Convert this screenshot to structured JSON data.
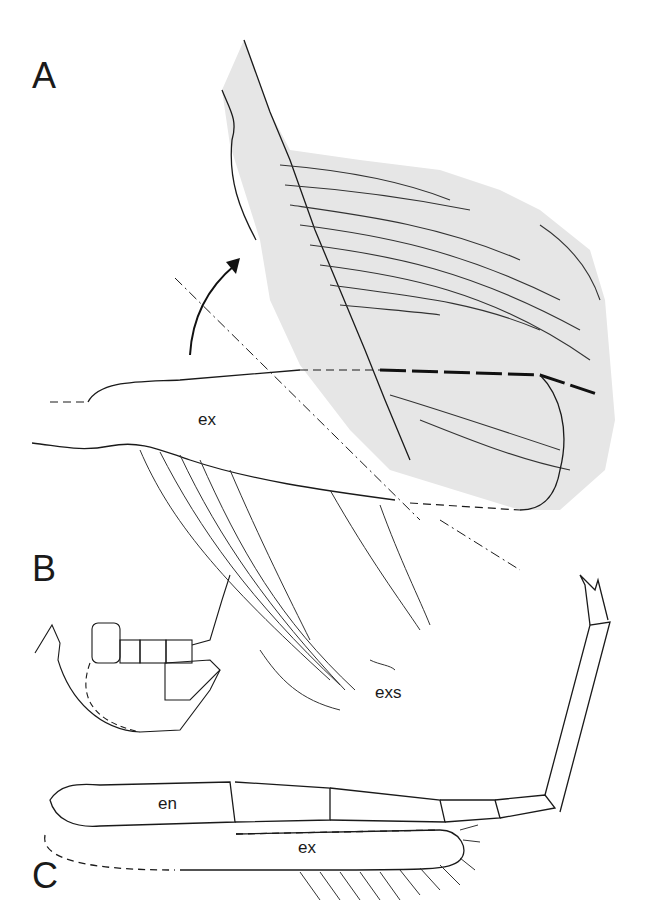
{
  "figure": {
    "panels": [
      {
        "id": "A",
        "label": "A"
      },
      {
        "id": "B",
        "label": "B"
      },
      {
        "id": "C",
        "label": "C"
      }
    ],
    "labels": {
      "a_ex": "ex",
      "b_exs": "exs",
      "c_en": "en",
      "c_ex": "ex"
    },
    "colors": {
      "shading": "#e6e6e6",
      "line": "#1a1a1a"
    }
  }
}
